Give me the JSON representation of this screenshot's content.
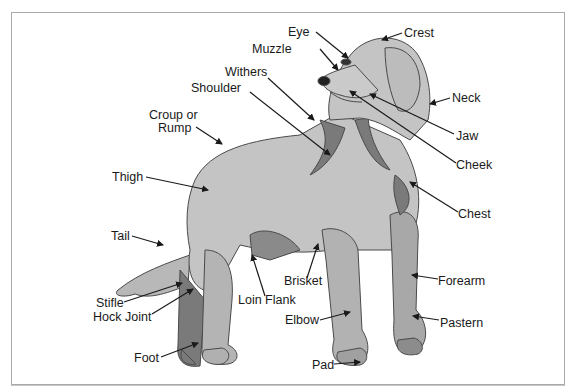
{
  "diagram": {
    "colors": {
      "fur_light": "#c4c4c4",
      "fur_mid": "#a8a8a8",
      "fur_dark": "#7a7a7a",
      "outline": "#4a4a4a",
      "arrow": "#1a1a1a",
      "frame": "#a9a9a9"
    },
    "labels": [
      {
        "id": "eye",
        "text": "Eye"
      },
      {
        "id": "crest",
        "text": "Crest"
      },
      {
        "id": "muzzle",
        "text": "Muzzle"
      },
      {
        "id": "withers",
        "text": "Withers"
      },
      {
        "id": "shoulder",
        "text": "Shoulder"
      },
      {
        "id": "neck",
        "text": "Neck"
      },
      {
        "id": "croup",
        "text": "Croup or"
      },
      {
        "id": "rump",
        "text": "Rump"
      },
      {
        "id": "jaw",
        "text": "Jaw"
      },
      {
        "id": "cheek",
        "text": "Cheek"
      },
      {
        "id": "thigh",
        "text": "Thigh"
      },
      {
        "id": "chest",
        "text": "Chest"
      },
      {
        "id": "tail",
        "text": "Tail"
      },
      {
        "id": "brisket",
        "text": "Brisket"
      },
      {
        "id": "forearm",
        "text": "Forearm"
      },
      {
        "id": "loin_flank",
        "text": "Loin Flank"
      },
      {
        "id": "stifle",
        "text": "Stifle"
      },
      {
        "id": "hock_joint",
        "text": "Hock Joint"
      },
      {
        "id": "elbow",
        "text": "Elbow"
      },
      {
        "id": "pastern",
        "text": "Pastern"
      },
      {
        "id": "foot",
        "text": "Foot"
      },
      {
        "id": "pad",
        "text": "Pad"
      }
    ]
  }
}
